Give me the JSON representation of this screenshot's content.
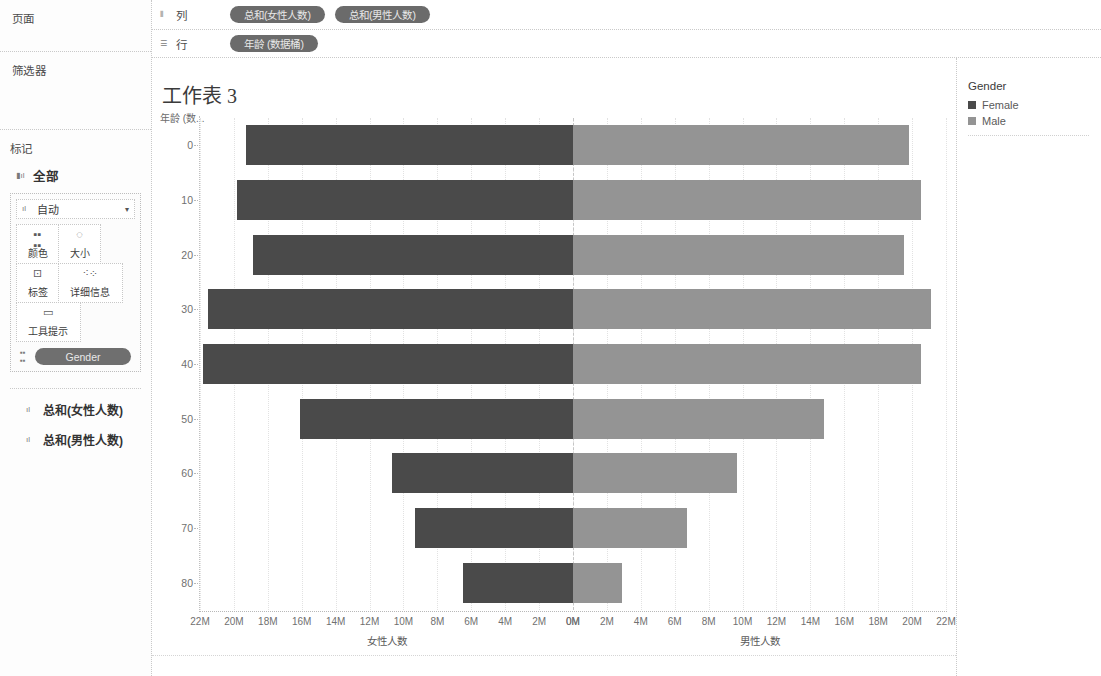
{
  "sidebar": {
    "pages": {
      "label": "页面"
    },
    "filters": {
      "label": "筛选器"
    },
    "marks": {
      "label": "标记",
      "all_label": "全部",
      "all_icon": "measure-icon",
      "mark_type": "自动",
      "mark_type_icon": "bar-icon",
      "caret": "▾",
      "properties": [
        {
          "name": "color",
          "label": "颜色",
          "icon": "color-squares-icon"
        },
        {
          "name": "size",
          "label": "大小",
          "icon": "size-icon"
        },
        {
          "name": "label",
          "label": "标签",
          "icon": "text-label-icon"
        },
        {
          "name": "detail",
          "label": "详细信息",
          "icon": "detail-dots-icon"
        },
        {
          "name": "tooltip",
          "label": "工具提示",
          "icon": "tooltip-bubble-icon"
        }
      ],
      "encoded_pill": {
        "label": "Gender",
        "icon": "color-squares-icon"
      }
    },
    "measures": [
      {
        "label": "总和(女性人数)",
        "icon": "measure-icon"
      },
      {
        "label": "总和(男性人数)",
        "icon": "measure-icon"
      }
    ]
  },
  "shelves": {
    "columns": {
      "label": "列",
      "icon": "columns-icon",
      "pills": [
        "总和(女性人数)",
        "总和(男性人数)"
      ]
    },
    "rows": {
      "label": "行",
      "icon": "rows-icon",
      "pills": [
        "年龄 (数据桶)"
      ]
    }
  },
  "worksheet": {
    "title": "工作表 3",
    "row_header_caption": "年龄 (数..."
  },
  "legend": {
    "title": "Gender",
    "items": [
      {
        "label": "Female",
        "color": "#4a4a4a"
      },
      {
        "label": "Male",
        "color": "#949494"
      }
    ]
  },
  "colors": {
    "female": "#4a4a4a",
    "male": "#949494",
    "pill": "#6b6b6b",
    "grid": "#e2e2e2",
    "text": "#5a5a5a"
  },
  "chart_data": {
    "type": "bar",
    "subtype": "population-pyramid",
    "title": "工作表 3",
    "orientation": "horizontal",
    "xlabel_left": "女性人数",
    "xlabel_right": "男性人数",
    "ylabel": "年龄 (数据桶)",
    "grid": true,
    "legend_position": "right",
    "categories": [
      0,
      10,
      20,
      30,
      40,
      50,
      60,
      70,
      80
    ],
    "category_labels": [
      "0",
      "10",
      "20",
      "30",
      "40",
      "50",
      "60",
      "70",
      "80"
    ],
    "axis_left": {
      "label": "女性人数",
      "range": [
        0,
        22000000
      ],
      "direction": "reversed",
      "tick_labels": [
        "22M",
        "20M",
        "18M",
        "16M",
        "14M",
        "12M",
        "10M",
        "8M",
        "6M",
        "4M",
        "2M",
        "0M"
      ],
      "tick_values": [
        22000000,
        20000000,
        18000000,
        16000000,
        14000000,
        12000000,
        10000000,
        8000000,
        6000000,
        4000000,
        2000000,
        0
      ]
    },
    "axis_right": {
      "label": "男性人数",
      "range": [
        0,
        22000000
      ],
      "direction": "normal",
      "tick_labels": [
        "0M",
        "2M",
        "4M",
        "6M",
        "8M",
        "10M",
        "12M",
        "14M",
        "16M",
        "18M",
        "20M",
        "22M"
      ],
      "tick_values": [
        0,
        2000000,
        4000000,
        6000000,
        8000000,
        10000000,
        12000000,
        14000000,
        16000000,
        18000000,
        20000000,
        22000000
      ]
    },
    "series": [
      {
        "name": "Female",
        "color": "#4a4a4a",
        "side": "left",
        "values": [
          19300000,
          19800000,
          18900000,
          21500000,
          21800000,
          16100000,
          10700000,
          9300000,
          6500000
        ]
      },
      {
        "name": "Male",
        "color": "#949494",
        "side": "right",
        "values": [
          19800000,
          20500000,
          19500000,
          21100000,
          20500000,
          14800000,
          9700000,
          6700000,
          2900000
        ]
      }
    ]
  }
}
